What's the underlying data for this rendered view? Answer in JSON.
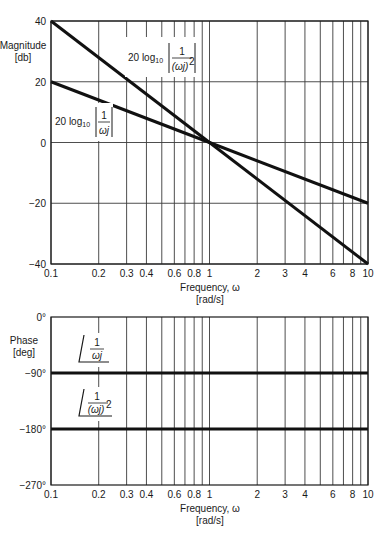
{
  "chart_data": [
    {
      "type": "line",
      "title": "",
      "xlabel": "Frequency, ω",
      "xlabel_units": "[rad/s]",
      "ylabel": "Magnitude",
      "ylabel_units": "[db]",
      "xscale": "log",
      "xlim": [
        0.1,
        10
      ],
      "ylim": [
        -40,
        40
      ],
      "x_ticks": [
        0.1,
        0.2,
        0.3,
        0.4,
        0.6,
        0.8,
        1,
        2,
        3,
        4,
        6,
        8,
        10
      ],
      "x_tick_labels": [
        "0.1",
        "0.2",
        "0.3",
        "0.4",
        "0.6",
        "0.8",
        "1",
        "2",
        "3",
        "4",
        "6",
        "8",
        "10"
      ],
      "x_gridlines": [
        0.1,
        0.2,
        0.3,
        0.4,
        0.5,
        0.6,
        0.7,
        0.8,
        0.9,
        1,
        2,
        3,
        4,
        5,
        6,
        7,
        8,
        9,
        10
      ],
      "y_ticks": [
        40,
        20,
        0,
        -20,
        -40
      ],
      "y_tick_labels": [
        "40",
        "20",
        "0",
        "−20",
        "−40"
      ],
      "grid": true,
      "series": [
        {
          "name": "20 log10 |1/(ωj)|",
          "x": [
            0.1,
            1,
            10
          ],
          "y": [
            20,
            0,
            -20
          ]
        },
        {
          "name": "20 log10 |1/(ωj)^2|",
          "x": [
            0.1,
            1,
            10
          ],
          "y": [
            40,
            0,
            -40
          ]
        }
      ],
      "annotations": [
        {
          "prefix": "20 log",
          "sub": "10",
          "numerator": "1",
          "denominator": "ωj",
          "power": "",
          "target": "20 log10 |1/(ωj)|"
        },
        {
          "prefix": "20 log",
          "sub": "10",
          "numerator": "1",
          "denominator": "(ωj)",
          "power": "2",
          "target": "20 log10 |1/(ωj)^2|"
        }
      ]
    },
    {
      "type": "line",
      "title": "",
      "xlabel": "Frequency, ω",
      "xlabel_units": "[rad/s]",
      "ylabel": "Phase",
      "ylabel_units": "[deg]",
      "xscale": "log",
      "xlim": [
        0.1,
        10
      ],
      "ylim": [
        -270,
        0
      ],
      "x_ticks": [
        0.1,
        0.2,
        0.3,
        0.4,
        0.6,
        0.8,
        1,
        2,
        3,
        4,
        6,
        8,
        10
      ],
      "x_tick_labels": [
        "0.1",
        "0.2",
        "0.3",
        "0.4",
        "0.6",
        "0.8",
        "1",
        "2",
        "3",
        "4",
        "6",
        "8",
        "10"
      ],
      "x_gridlines": [
        0.1,
        0.2,
        0.3,
        0.4,
        0.5,
        0.6,
        0.7,
        0.8,
        0.9,
        1,
        2,
        3,
        4,
        5,
        6,
        7,
        8,
        9,
        10
      ],
      "y_ticks": [
        0,
        -90,
        -180,
        -270
      ],
      "y_tick_labels": [
        "0°",
        "−90°",
        "−180°",
        "−270°"
      ],
      "grid": false,
      "series": [
        {
          "name": "∠1/(ωj)",
          "x": [
            0.1,
            10
          ],
          "y": [
            -90,
            -90
          ]
        },
        {
          "name": "∠1/(ωj)^2",
          "x": [
            0.1,
            10
          ],
          "y": [
            -180,
            -180
          ]
        }
      ],
      "annotations": [
        {
          "numerator": "1",
          "denominator": "ωj",
          "power": "",
          "target": "∠1/(ωj)"
        },
        {
          "numerator": "1",
          "denominator": "(ωj)",
          "power": "2",
          "target": "∠1/(ωj)^2"
        }
      ]
    }
  ],
  "style": {
    "grid_color": "#3a3a3a",
    "line_color": "#111111",
    "frame_color": "#1a1a1a"
  }
}
